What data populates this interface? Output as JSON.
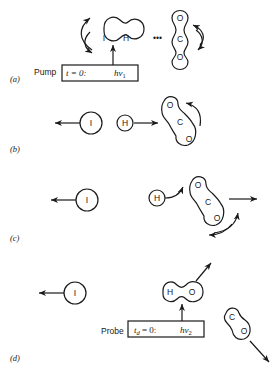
{
  "panels": [
    {
      "label": "(a)",
      "pump": {
        "label": "Pump",
        "time": "t = 0:",
        "photon": "hν",
        "photon_sub": "1"
      },
      "molecules": [
        "I",
        "H"
      ],
      "partner": [
        "O",
        "C",
        "O"
      ],
      "ellipsis": "•••"
    },
    {
      "label": "(b)",
      "atoms": [
        "I",
        "H"
      ],
      "partner": [
        "O",
        "C",
        "O"
      ]
    },
    {
      "label": "(c)",
      "atoms": [
        "I",
        "H"
      ],
      "partner": [
        "O",
        "C",
        "O"
      ]
    },
    {
      "label": "(d)",
      "atoms": [
        "I"
      ],
      "product_oh": [
        "H",
        "O"
      ],
      "product_co": [
        "C",
        "O"
      ],
      "probe": {
        "label": "Probe",
        "time": "t",
        "time_sub": "d",
        "time_rest": " = 0:",
        "photon": "hν",
        "photon_sub": "2"
      }
    }
  ]
}
